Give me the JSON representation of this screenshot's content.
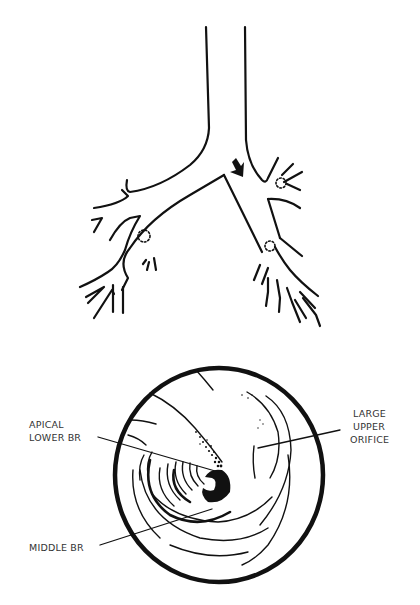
{
  "figure": {
    "top_panel": {
      "name": "bronchial-tree",
      "arrow_icon": "down-right-arrow"
    },
    "bottom_panel": {
      "name": "bronchoscopic-view",
      "labels": {
        "apical_lower_br": {
          "line1": "APICAL",
          "line2": "LOWER BR"
        },
        "middle_br": {
          "line1": "MIDDLE BR"
        },
        "large_upper_orifice": {
          "line1": "LARGE",
          "line2": "UPPER",
          "line3": "ORIFICE"
        }
      }
    },
    "colors": {
      "ink": "#111111",
      "label_text": "#333333",
      "background": "#ffffff"
    }
  }
}
